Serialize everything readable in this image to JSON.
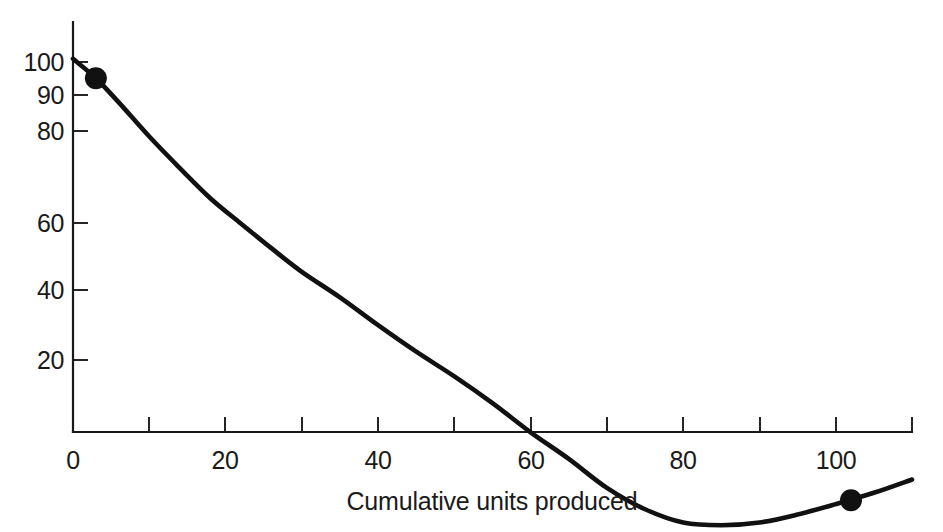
{
  "chart_data": {
    "type": "line",
    "title": "",
    "subtitle": "",
    "xlabel": "Cumulative units produced",
    "ylabel": "",
    "xlim": [
      0,
      110
    ],
    "ylim": [
      15,
      110
    ],
    "yscale": "log",
    "xscale": "linear",
    "grid": false,
    "legend": null,
    "x_ticks_major": [
      0,
      20,
      40,
      60,
      80,
      100
    ],
    "x_tick_labels": [
      "0",
      "20",
      "40",
      "60",
      "80",
      "100"
    ],
    "x_ticks_minor": [
      10,
      30,
      50,
      70,
      90,
      110
    ],
    "y_ticks_major": [
      20,
      40,
      60,
      80,
      90,
      100
    ],
    "y_tick_labels": [
      "20",
      "40",
      "60",
      "80",
      "90",
      "100"
    ],
    "series": [
      {
        "name": "unit cost",
        "x": [
          0,
          3,
          6,
          10,
          14,
          18,
          22,
          26,
          30,
          35,
          40,
          45,
          50,
          55,
          60,
          65,
          70,
          75,
          80,
          85,
          90,
          95,
          100,
          105,
          110
        ],
        "y": [
          101,
          95,
          88,
          79,
          71.5,
          65,
          60,
          55.5,
          51.5,
          47.5,
          43.5,
          40,
          37,
          34,
          31,
          28.5,
          26,
          24.3,
          23.3,
          23.1,
          23.3,
          23.9,
          24.7,
          25.6,
          26.7
        ]
      }
    ],
    "markers": [
      {
        "label": "start-point",
        "x": 3,
        "y": 95
      },
      {
        "label": "end-point",
        "x": 102,
        "y": 25
      }
    ]
  },
  "axis": {
    "x_title": "Cumulative units produced",
    "x_labels": [
      "0",
      "20",
      "40",
      "60",
      "80",
      "100"
    ],
    "y_labels": [
      "100",
      "90",
      "80",
      "60",
      "40",
      "20"
    ]
  },
  "colors": {
    "curve": "#111111",
    "axis": "#1a1a1a",
    "marker": "#111111",
    "background": "#ffffff"
  }
}
